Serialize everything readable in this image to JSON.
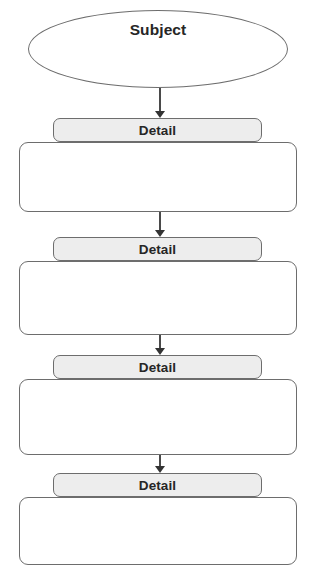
{
  "diagram": {
    "colors": {
      "page_background": "#ffffff",
      "shape_border": "#6d6d6d",
      "header_fill": "#ededed",
      "body_fill": "#ffffff",
      "text": "#262626",
      "arrow": "#333333"
    },
    "subject": {
      "label": "Subject",
      "shape": "ellipse"
    },
    "groups": [
      {
        "header_label": "Detail",
        "body_text": ""
      },
      {
        "header_label": "Detail",
        "body_text": ""
      },
      {
        "header_label": "Detail",
        "body_text": ""
      },
      {
        "header_label": "Detail",
        "body_text": ""
      }
    ],
    "connectors": [
      {
        "name": "subject-to-detail-1"
      },
      {
        "name": "detail-1-to-detail-2"
      },
      {
        "name": "detail-2-to-detail-3"
      },
      {
        "name": "detail-3-to-detail-4"
      }
    ]
  }
}
